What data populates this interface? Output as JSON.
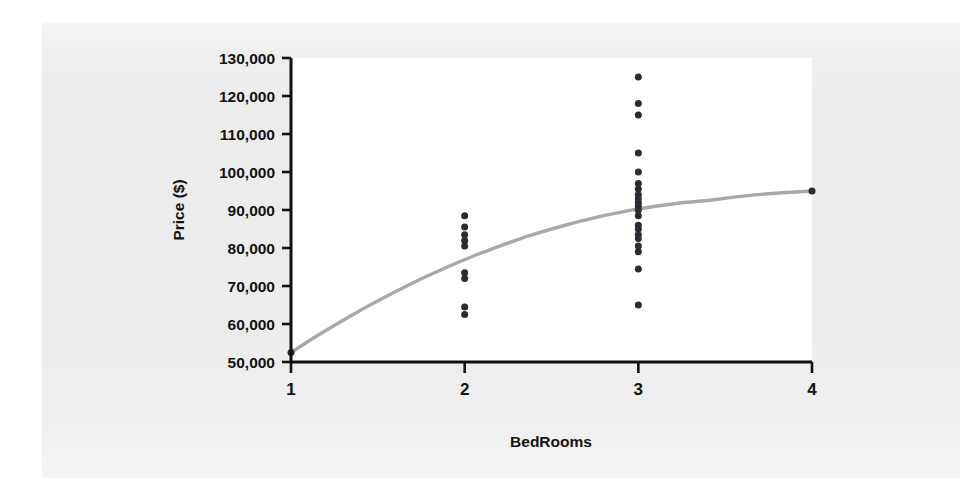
{
  "figure": {
    "background_color": "#ececec",
    "plot_area_color": "#ffffff",
    "axis_color": "#111111"
  },
  "chart_data": {
    "type": "scatter",
    "title": "",
    "subtitle": "",
    "xlabel": "BedRooms",
    "ylabel": "Price ($)",
    "xlim": [
      1,
      4
    ],
    "ylim": [
      50000,
      130000
    ],
    "xticks": [
      1,
      2,
      3,
      4
    ],
    "xtick_labels": [
      "1",
      "2",
      "3",
      "4"
    ],
    "yticks": [
      50000,
      60000,
      70000,
      80000,
      90000,
      100000,
      110000,
      120000,
      130000
    ],
    "ytick_labels": [
      "50,000",
      "60,000",
      "70,000",
      "80,000",
      "90,000",
      "100,000",
      "110,000",
      "120,000",
      "130,000"
    ],
    "grid": false,
    "legend": null,
    "legend_position": "none",
    "marker_color": "#2b2b33",
    "marker_size": 7,
    "series": [
      {
        "name": "Observations",
        "type": "scatter",
        "x": [
          1,
          2,
          2,
          2,
          2,
          2,
          2,
          2,
          2,
          2,
          3,
          3,
          3,
          3,
          3,
          3,
          3,
          3,
          3,
          3,
          3,
          3,
          3,
          3,
          3,
          3,
          3,
          3,
          3,
          3,
          3,
          4
        ],
        "y": [
          52500,
          88500,
          85500,
          83500,
          82000,
          80500,
          73500,
          72000,
          64500,
          62500,
          125000,
          118000,
          115000,
          105000,
          100000,
          97000,
          95500,
          94000,
          93000,
          92000,
          91000,
          90000,
          88500,
          86000,
          85000,
          83500,
          82500,
          80500,
          79000,
          74500,
          65000,
          95000
        ]
      },
      {
        "name": "Fitted quadratic",
        "type": "line",
        "color": "#a8a8a8",
        "x": [
          1.0,
          1.15,
          1.3,
          1.45,
          1.6,
          1.75,
          1.9,
          2.05,
          2.2,
          2.35,
          2.5,
          2.65,
          2.8,
          2.95,
          3.1,
          3.25,
          3.4,
          3.55,
          3.7,
          3.85,
          4.0
        ],
        "y": [
          52500,
          56900,
          61000,
          64900,
          68500,
          71900,
          75000,
          77900,
          80500,
          82900,
          85000,
          86900,
          88500,
          89900,
          91000,
          91900,
          92500,
          93400,
          94100,
          94600,
          95000
        ]
      }
    ],
    "cluster_summary": [
      {
        "bedrooms": 1,
        "count": 1,
        "min_price": 52500,
        "max_price": 52500
      },
      {
        "bedrooms": 2,
        "count": 9,
        "min_price": 62500,
        "max_price": 88500
      },
      {
        "bedrooms": 3,
        "count": 21,
        "min_price": 65000,
        "max_price": 125000
      },
      {
        "bedrooms": 4,
        "count": 1,
        "min_price": 95000,
        "max_price": 95000
      }
    ]
  }
}
